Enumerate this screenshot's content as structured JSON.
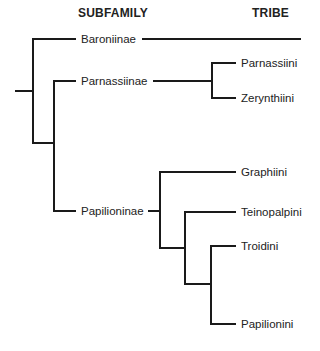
{
  "headers": {
    "subfamily": "SUBFAMILY",
    "tribe": "TRIBE"
  },
  "subfamilies": [
    {
      "name": "Baroniinae"
    },
    {
      "name": "Parnassiinae"
    },
    {
      "name": "Papilioninae"
    }
  ],
  "tribes": [
    {
      "name": "Parnassiini",
      "subfamily": "Parnassiinae"
    },
    {
      "name": "Zerynthiini",
      "subfamily": "Parnassiinae"
    },
    {
      "name": "Graphiini",
      "subfamily": "Papilioninae"
    },
    {
      "name": "Teinopalpini",
      "subfamily": "Papilioninae"
    },
    {
      "name": "Troidini",
      "subfamily": "Papilioninae"
    },
    {
      "name": "Papilionini",
      "subfamily": "Papilioninae"
    }
  ],
  "colors": {
    "line": "#1a1a1a",
    "text": "#222222",
    "background": "#ffffff"
  }
}
